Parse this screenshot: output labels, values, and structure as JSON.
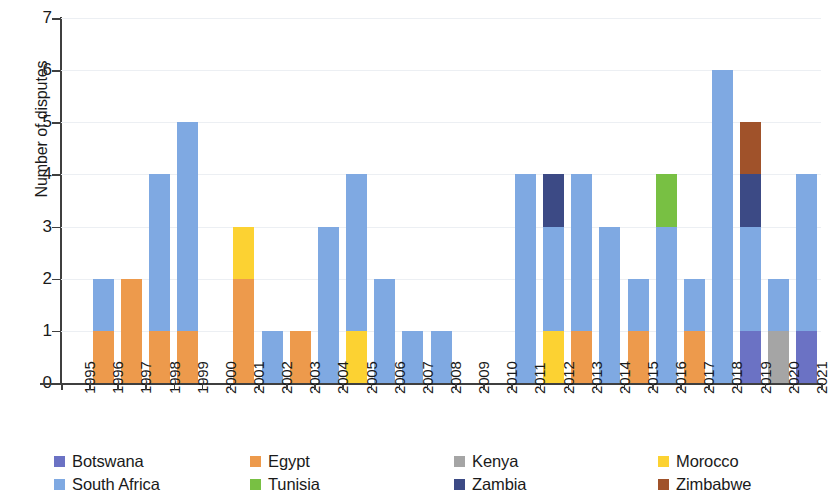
{
  "chart_data": {
    "type": "bar",
    "subtype": "stacked-bar",
    "title": "",
    "xlabel": "",
    "ylabel": "Number of disputes",
    "ylim": [
      0,
      7
    ],
    "ytick_labels": [
      "0",
      "1",
      "2",
      "3",
      "4",
      "5",
      "6",
      "7"
    ],
    "ytick_values": [
      0,
      1,
      2,
      3,
      4,
      5,
      6,
      7
    ],
    "grid": true,
    "grid_axis": "y",
    "legend_position": "bottom",
    "stack_order": [
      "Botswana",
      "Egypt",
      "Kenya",
      "Morocco",
      "South Africa",
      "Tunisia",
      "Zambia",
      "Zimbabwe"
    ],
    "categories": [
      "1995",
      "1996",
      "1997",
      "1998",
      "1999",
      "2000",
      "2001",
      "2002",
      "2003",
      "2004",
      "2005",
      "2006",
      "2007",
      "2008",
      "2009",
      "2010",
      "2011",
      "2012",
      "2013",
      "2014",
      "2015",
      "2016",
      "2017",
      "2018",
      "2019",
      "2020",
      "2021"
    ],
    "series": [
      {
        "name": "Botswana",
        "color": "#6B72C4",
        "values": [
          0,
          0,
          0,
          0,
          0,
          0,
          0,
          0,
          0,
          0,
          0,
          0,
          0,
          0,
          0,
          0,
          0,
          0,
          0,
          0,
          0,
          0,
          0,
          0,
          1,
          0,
          1
        ]
      },
      {
        "name": "Egypt",
        "color": "#ED9A4C",
        "values": [
          0,
          1,
          2,
          1,
          1,
          0,
          2,
          0,
          1,
          0,
          0,
          0,
          0,
          0,
          0,
          0,
          0,
          0,
          1,
          0,
          1,
          0,
          1,
          0,
          0,
          0,
          0
        ]
      },
      {
        "name": "Kenya",
        "color": "#A5A5A5",
        "values": [
          0,
          0,
          0,
          0,
          0,
          0,
          0,
          0,
          0,
          0,
          0,
          0,
          0,
          0,
          0,
          0,
          0,
          0,
          0,
          0,
          0,
          0,
          0,
          0,
          0,
          1,
          0
        ]
      },
      {
        "name": "Morocco",
        "color": "#FCD232",
        "values": [
          0,
          0,
          0,
          0,
          0,
          0,
          1,
          0,
          0,
          0,
          1,
          0,
          0,
          0,
          0,
          0,
          0,
          1,
          0,
          0,
          0,
          0,
          0,
          0,
          0,
          0,
          0
        ]
      },
      {
        "name": "South Africa",
        "color": "#7FA9E2",
        "values": [
          0,
          1,
          0,
          3,
          4,
          0,
          0,
          1,
          0,
          3,
          3,
          2,
          1,
          1,
          0,
          0,
          4,
          2,
          3,
          3,
          1,
          3,
          1,
          6,
          2,
          1,
          3
        ]
      },
      {
        "name": "Tunisia",
        "color": "#78C043",
        "values": [
          0,
          0,
          0,
          0,
          0,
          0,
          0,
          0,
          0,
          0,
          0,
          0,
          0,
          0,
          0,
          0,
          0,
          0,
          0,
          0,
          0,
          1,
          0,
          0,
          0,
          0,
          0
        ]
      },
      {
        "name": "Zambia",
        "color": "#3C4A85",
        "values": [
          0,
          0,
          0,
          0,
          0,
          0,
          0,
          0,
          0,
          0,
          0,
          0,
          0,
          0,
          0,
          0,
          0,
          1,
          0,
          0,
          0,
          0,
          0,
          0,
          1,
          0,
          0
        ]
      },
      {
        "name": "Zimbabwe",
        "color": "#A0522A",
        "values": [
          0,
          0,
          0,
          0,
          0,
          0,
          0,
          0,
          0,
          0,
          0,
          0,
          0,
          0,
          0,
          0,
          0,
          0,
          0,
          0,
          0,
          0,
          0,
          0,
          1,
          0,
          0
        ]
      }
    ],
    "totals": [
      0,
      2,
      2,
      4,
      5,
      0,
      3,
      1,
      1,
      3,
      4,
      2,
      1,
      1,
      0,
      0,
      4,
      4,
      4,
      3,
      2,
      4,
      2,
      6,
      5,
      2,
      4
    ]
  },
  "legend": {
    "items": [
      {
        "label": "Botswana",
        "color": "#6B72C4"
      },
      {
        "label": "Egypt",
        "color": "#ED9A4C"
      },
      {
        "label": "Kenya",
        "color": "#A5A5A5"
      },
      {
        "label": "Morocco",
        "color": "#FCD232"
      },
      {
        "label": "South Africa",
        "color": "#7FA9E2"
      },
      {
        "label": "Tunisia",
        "color": "#78C043"
      },
      {
        "label": "Zambia",
        "color": "#3C4A85"
      },
      {
        "label": "Zimbabwe",
        "color": "#A0522A"
      }
    ]
  },
  "axes": {
    "y_title": "Number of disputes"
  }
}
